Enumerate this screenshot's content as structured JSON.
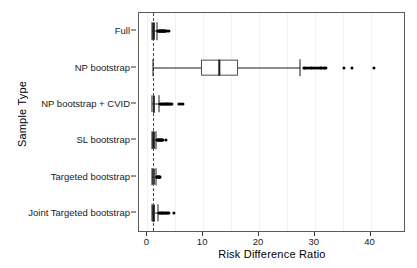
{
  "chart_data": {
    "type": "boxplot",
    "title": "",
    "xlabel": "Risk Difference Ratio",
    "ylabel": "Sample Type",
    "orientation": "horizontal",
    "xlim": [
      -1.5,
      46
    ],
    "xticks": [
      0,
      10,
      20,
      30,
      40
    ],
    "xtick_labels": [
      "0",
      "10",
      "20",
      "30",
      "40"
    ],
    "grid": "minor-vertical-light",
    "legend": "none",
    "reference_line": {
      "x": 1,
      "style": "dashed",
      "color": "#4d4d4d"
    },
    "categories": [
      "Full",
      "NP bootstrap",
      "NP bootstrap + CVID",
      "SL bootstrap",
      "Targeted bootstrap",
      "Joint Targeted bootstrap"
    ],
    "boxes": [
      {
        "category": "Full",
        "whisker_low": 0.85,
        "q1": 0.95,
        "median": 1.05,
        "q3": 1.25,
        "whisker_high": 1.7,
        "outliers": [
          1.9,
          2.0,
          2.1,
          2.2,
          2.3,
          2.4,
          2.5,
          2.6,
          2.7,
          2.8,
          2.9,
          3.0,
          3.1,
          3.2,
          3.4,
          3.8
        ]
      },
      {
        "category": "NP bootstrap",
        "whisker_low": 1.0,
        "q1": 9.6,
        "median": 12.9,
        "q3": 16.2,
        "whisker_high": 27.4,
        "outliers": [
          28.0,
          28.3,
          28.6,
          29.0,
          29.4,
          29.8,
          30.2,
          30.6,
          31.0,
          31.3,
          31.6,
          31.9,
          35.3,
          36.6,
          40.6
        ]
      },
      {
        "category": "NP bootstrap + CVID",
        "whisker_low": 0.9,
        "q1": 1.0,
        "median": 1.1,
        "q3": 1.35,
        "whisker_high": 2.0,
        "outliers": [
          2.2,
          2.4,
          2.6,
          2.8,
          3.0,
          3.2,
          3.4,
          3.6,
          3.8,
          4.0,
          4.2,
          4.4,
          5.6,
          6.0,
          6.3
        ]
      },
      {
        "category": "SL bootstrap",
        "whisker_low": 0.85,
        "q1": 0.95,
        "median": 1.05,
        "q3": 1.2,
        "whisker_high": 1.6,
        "outliers": [
          1.8,
          1.9,
          2.0,
          2.1,
          2.2,
          2.3,
          2.4,
          2.5,
          2.6,
          2.8,
          3.3
        ]
      },
      {
        "category": "Targeted bootstrap",
        "whisker_low": 0.85,
        "q1": 0.95,
        "median": 1.0,
        "q3": 1.15,
        "whisker_high": 1.5,
        "outliers": [
          1.7,
          1.8,
          1.9,
          2.0,
          2.1,
          2.2,
          2.3
        ]
      },
      {
        "category": "Joint Targeted bootstrap",
        "whisker_low": 0.85,
        "q1": 0.95,
        "median": 1.05,
        "q3": 1.3,
        "whisker_high": 1.9,
        "outliers": [
          2.1,
          2.3,
          2.5,
          2.7,
          2.9,
          3.1,
          3.3,
          3.5,
          3.7,
          3.9,
          4.8
        ]
      }
    ]
  },
  "axes": {
    "x_title": "Risk Difference Ratio",
    "y_title": "Sample Type",
    "x_tick_labels": [
      "0",
      "10",
      "20",
      "30",
      "40"
    ],
    "y_tick_labels": [
      "Full",
      "NP bootstrap",
      "NP bootstrap + CVID",
      "SL bootstrap",
      "Targeted bootstrap",
      "Joint Targeted bootstrap"
    ]
  },
  "colors": {
    "panel_border": "#5a5a5a",
    "box_border": "#4d4d4d",
    "line": "#1a1a1a",
    "outlier": "#000000",
    "gridline": "#f2f2f2",
    "background": "#ffffff"
  }
}
